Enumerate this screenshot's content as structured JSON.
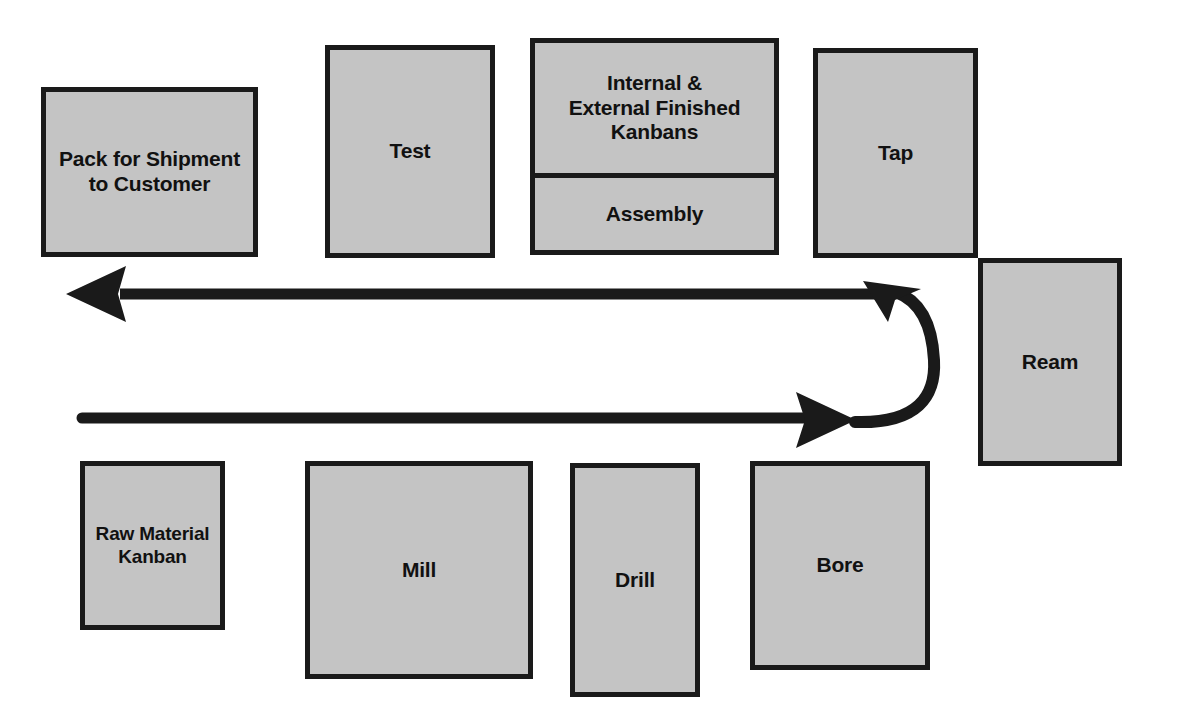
{
  "diagram": {
    "background_color": "#ffffff",
    "box_fill_color": "#c4c4c4",
    "box_border_color": "#1a1a1a",
    "arrow_color": "#1a1a1a",
    "text_color": "#111111"
  },
  "nodes": {
    "pack": {
      "label": "Pack for Shipment\nto Customer",
      "line1": "Pack for Shipment",
      "line2": "to Customer",
      "font_size": "21px"
    },
    "test": {
      "label": "Test",
      "font_size": "21px"
    },
    "kanbans": {
      "line1": "Internal &",
      "line2": "External Finished",
      "line3": "Kanbans",
      "font_size": "21px"
    },
    "assembly": {
      "label": "Assembly",
      "font_size": "21px"
    },
    "tap": {
      "label": "Tap",
      "font_size": "21px"
    },
    "ream": {
      "label": "Ream",
      "font_size": "21px"
    },
    "bore": {
      "label": "Bore",
      "font_size": "21px"
    },
    "drill": {
      "label": "Drill",
      "font_size": "21px"
    },
    "mill": {
      "label": "Mill",
      "font_size": "21px"
    },
    "raw_material": {
      "line1": "Raw Material",
      "line2": "Kanban",
      "font_size": "19px"
    }
  },
  "flow": {
    "return_arrow_name": "finished-goods-return-flow",
    "forward_arrow_name": "raw-material-forward-flow",
    "uturn_name": "u-turn-connector"
  }
}
